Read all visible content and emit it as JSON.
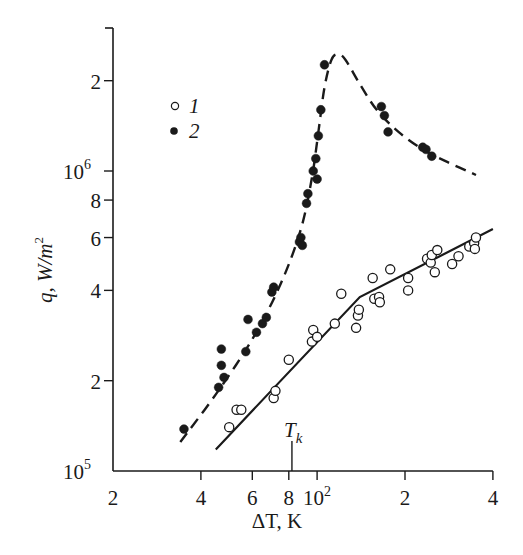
{
  "chart_data": {
    "type": "scatter",
    "title": "",
    "xlabel": "ΔT, K",
    "ylabel": "q, W/m²",
    "xscale": "log",
    "yscale": "log",
    "xlim": [
      20,
      400
    ],
    "ylim": [
      100000,
      3000000
    ],
    "grid": false,
    "legend_position": "upper-left-inside",
    "x_ticks": [
      {
        "value": 20,
        "label": "2"
      },
      {
        "value": 40,
        "label": "4"
      },
      {
        "value": 60,
        "label": "6"
      },
      {
        "value": 80,
        "label": "8"
      },
      {
        "value": 100,
        "label": "10",
        "sup": "2"
      },
      {
        "value": 200,
        "label": "2"
      },
      {
        "value": 400,
        "label": "4"
      }
    ],
    "y_ticks": [
      {
        "value": 100000,
        "label": "10",
        "sup": "5"
      },
      {
        "value": 200000,
        "label": "2"
      },
      {
        "value": 400000,
        "label": "4"
      },
      {
        "value": 600000,
        "label": "6"
      },
      {
        "value": 800000,
        "label": "8"
      },
      {
        "value": 1000000,
        "label": "10",
        "sup": "6"
      },
      {
        "value": 2000000,
        "label": "2"
      }
    ],
    "annotations": [
      {
        "text": "T",
        "sub": "k",
        "x": 82,
        "marker": "vertical-tick-above-axis"
      }
    ],
    "series": [
      {
        "name": "1",
        "marker": "open-circle",
        "line_style": "solid",
        "points": [
          [
            50,
            140000
          ],
          [
            53,
            160000
          ],
          [
            55,
            160000
          ],
          [
            71,
            175000
          ],
          [
            72,
            185000
          ],
          [
            80,
            235000
          ],
          [
            96,
            270000
          ],
          [
            97,
            295000
          ],
          [
            100,
            280000
          ],
          [
            115,
            310000
          ],
          [
            121,
            390000
          ],
          [
            136,
            300000
          ],
          [
            138,
            330000
          ],
          [
            139,
            345000
          ],
          [
            155,
            440000
          ],
          [
            157,
            375000
          ],
          [
            163,
            380000
          ],
          [
            164,
            365000
          ],
          [
            178,
            470000
          ],
          [
            205,
            440000
          ],
          [
            205,
            400000
          ],
          [
            238,
            510000
          ],
          [
            245,
            495000
          ],
          [
            247,
            525000
          ],
          [
            253,
            460000
          ],
          [
            258,
            545000
          ],
          [
            290,
            490000
          ],
          [
            305,
            520000
          ],
          [
            332,
            560000
          ],
          [
            345,
            575000
          ],
          [
            347,
            550000
          ],
          [
            350,
            600000
          ]
        ],
        "fit_line": [
          [
            45,
            118000
          ],
          [
            140,
            380000
          ],
          [
            400,
            640000
          ]
        ]
      },
      {
        "name": "2",
        "marker": "filled-circle",
        "line_style": "dashed",
        "points": [
          [
            35,
            138000
          ],
          [
            46,
            190000
          ],
          [
            47,
            225000
          ],
          [
            47,
            255000
          ],
          [
            48,
            205000
          ],
          [
            57,
            250000
          ],
          [
            58,
            320000
          ],
          [
            62,
            290000
          ],
          [
            65,
            310000
          ],
          [
            67,
            325000
          ],
          [
            70,
            395000
          ],
          [
            71,
            410000
          ],
          [
            87,
            580000
          ],
          [
            88,
            600000
          ],
          [
            89,
            565000
          ],
          [
            92,
            780000
          ],
          [
            93,
            840000
          ],
          [
            97,
            1000000
          ],
          [
            99,
            1100000
          ],
          [
            100,
            940000
          ],
          [
            101,
            1310000
          ],
          [
            103,
            1600000
          ],
          [
            106,
            2260000
          ],
          [
            166,
            1640000
          ],
          [
            170,
            1530000
          ],
          [
            175,
            1350000
          ],
          [
            230,
            1200000
          ],
          [
            236,
            1180000
          ],
          [
            247,
            1120000
          ]
        ],
        "fit_curve": [
          [
            34,
            125000
          ],
          [
            45,
            180000
          ],
          [
            60,
            275000
          ],
          [
            75,
            420000
          ],
          [
            88,
            640000
          ],
          [
            96,
            950000
          ],
          [
            101,
            1350000
          ],
          [
            106,
            1900000
          ],
          [
            112,
            2350000
          ],
          [
            118,
            2450000
          ],
          [
            125,
            2350000
          ],
          [
            140,
            1950000
          ],
          [
            160,
            1600000
          ],
          [
            190,
            1350000
          ],
          [
            230,
            1180000
          ],
          [
            280,
            1070000
          ],
          [
            350,
            970000
          ]
        ]
      }
    ]
  },
  "legend": {
    "items": [
      {
        "label": "1",
        "marker": "open-circle"
      },
      {
        "label": "2",
        "marker": "filled-circle"
      }
    ]
  },
  "axes": {
    "x_label_main": "ΔT, K",
    "y_label_main": "q,  W/m",
    "y_label_sup": "2",
    "tk_label": "T",
    "tk_sub": "k"
  },
  "colors": {
    "ink": "#1a1a1a",
    "background": "#ffffff"
  }
}
